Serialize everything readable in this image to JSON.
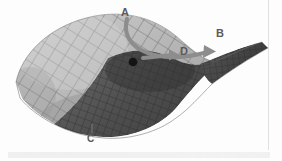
{
  "figure": {
    "kind": "3d-surface-mesh-diagram",
    "background_color": "#fdfdfd",
    "labels": [
      {
        "id": "A",
        "text": "A",
        "role": "curved-arrow-origin"
      },
      {
        "id": "B",
        "text": "B",
        "role": "curved-arrow-target"
      },
      {
        "id": "C",
        "text": "C",
        "role": "leader-line-callout"
      },
      {
        "id": "D",
        "text": "D",
        "role": "straight-arrow-target"
      }
    ],
    "annotations": {
      "curved_arrow": {
        "from_label": "A",
        "to_label": "B",
        "color": "#8d8d8d"
      },
      "straight_arrow": {
        "to_label": "D",
        "color": "#8d8d8d"
      },
      "leader_line": {
        "to_label": "C",
        "color": "#6f6f6f"
      },
      "marker_dot": {
        "name": "saddle-point-dot",
        "color": "#141414"
      }
    },
    "surface_colors": {
      "light_face": "#b9b9b9",
      "mid_face": "#9a9a9a",
      "dark_face": "#5a5a5a",
      "darkest_face": "#3d3d3d",
      "mesh_line": "#6a6a6a"
    }
  }
}
